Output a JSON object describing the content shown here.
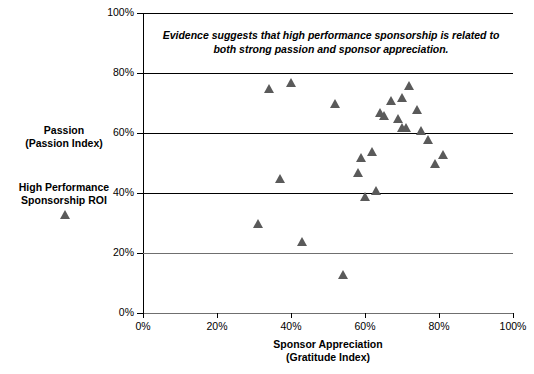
{
  "chart_data": {
    "type": "scatter",
    "title": "",
    "annotation": "Evidence suggests that high performance sponsorship is related to both strong passion and sponsor appreciation.",
    "xlabel": "Sponsor Appreciation",
    "xlabel_sub": "(Gratitude Index)",
    "ylabel": "Passion",
    "ylabel_sub": "(Passion Index)",
    "series_legend_label": "High Performance",
    "series_legend_label_sub": "Sponsorship ROI",
    "xlim": [
      0,
      100
    ],
    "ylim": [
      0,
      100
    ],
    "xticks": [
      "0%",
      "20%",
      "40%",
      "60%",
      "80%",
      "100%"
    ],
    "xtick_values": [
      0,
      20,
      40,
      60,
      80,
      100
    ],
    "yticks": [
      "0%",
      "20%",
      "40%",
      "60%",
      "80%",
      "100%"
    ],
    "ytick_values": [
      0,
      20,
      40,
      60,
      80,
      100
    ],
    "grid": "horizontal",
    "marker": "triangle",
    "marker_color": "#5a5a5a",
    "legend_position": "left-outside",
    "points": [
      {
        "x": 34,
        "y": 75
      },
      {
        "x": 40,
        "y": 77
      },
      {
        "x": 52,
        "y": 70
      },
      {
        "x": 64,
        "y": 67
      },
      {
        "x": 65,
        "y": 66
      },
      {
        "x": 67,
        "y": 71
      },
      {
        "x": 70,
        "y": 72
      },
      {
        "x": 72,
        "y": 76
      },
      {
        "x": 69,
        "y": 65
      },
      {
        "x": 74,
        "y": 68
      },
      {
        "x": 70,
        "y": 62
      },
      {
        "x": 71,
        "y": 62
      },
      {
        "x": 75,
        "y": 61
      },
      {
        "x": 77,
        "y": 58
      },
      {
        "x": 81,
        "y": 53
      },
      {
        "x": 79,
        "y": 50
      },
      {
        "x": 62,
        "y": 54
      },
      {
        "x": 59,
        "y": 52
      },
      {
        "x": 58,
        "y": 47
      },
      {
        "x": 60,
        "y": 39
      },
      {
        "x": 63,
        "y": 41
      },
      {
        "x": 31,
        "y": 30
      },
      {
        "x": 37,
        "y": 45
      },
      {
        "x": 43,
        "y": 24
      },
      {
        "x": 54,
        "y": 13
      }
    ]
  }
}
